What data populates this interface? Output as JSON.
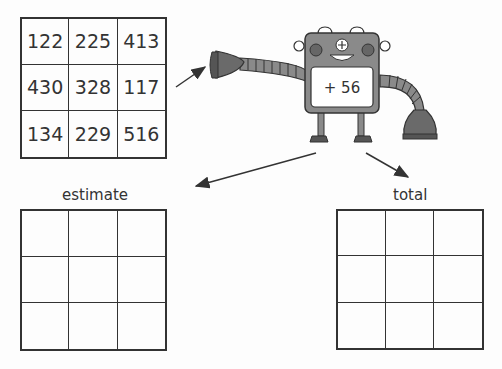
{
  "source_grid": {
    "cells": [
      "122",
      "225",
      "413",
      "430",
      "328",
      "117",
      "134",
      "229",
      "516"
    ]
  },
  "robot": {
    "operation": "+ 56",
    "body_color": "#8a8a8a",
    "dark_color": "#5a5a5a"
  },
  "estimate_grid": {
    "label": "estimate",
    "cells": [
      "",
      "",
      "",
      "",
      "",
      "",
      "",
      "",
      ""
    ]
  },
  "total_grid": {
    "label": "total",
    "cells": [
      "",
      "",
      "",
      "",
      "",
      "",
      "",
      "",
      ""
    ]
  }
}
